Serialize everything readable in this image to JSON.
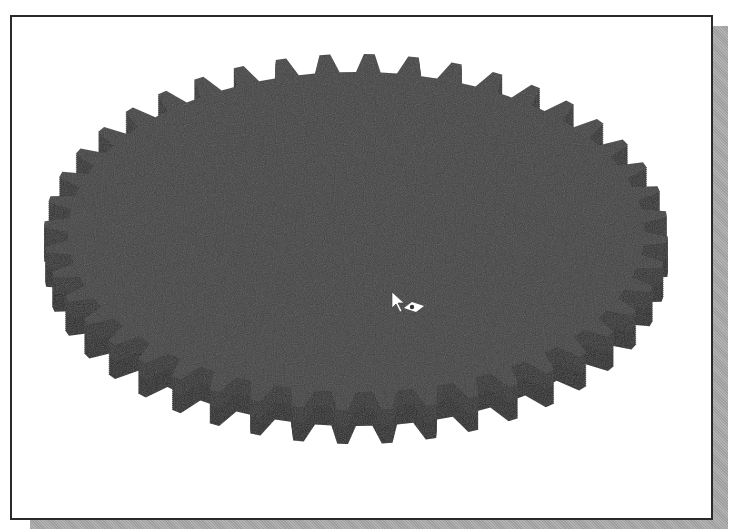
{
  "viewport": {
    "title": "3D model view - spur gear",
    "background": "#ffffff",
    "border_color": "#2a2a2a",
    "shadow_color": "#a8a8a8"
  },
  "model": {
    "name": "spur-gear",
    "teeth_count": 44,
    "top_face_color": "#3e3e3e",
    "side_color": "#232323",
    "side_mid_color": "#2c2c2c",
    "center": [
      356,
      232
    ],
    "outer_radius_x": 312,
    "outer_radius_y": 178,
    "root_radius_x": 288,
    "root_radius_y": 160,
    "extrusion_depth": 34
  },
  "cursor": {
    "icon": "rotate-view-cursor",
    "position": [
      392,
      292
    ],
    "arrow_color": "#ffffff",
    "badge_color": "#ffffff"
  }
}
